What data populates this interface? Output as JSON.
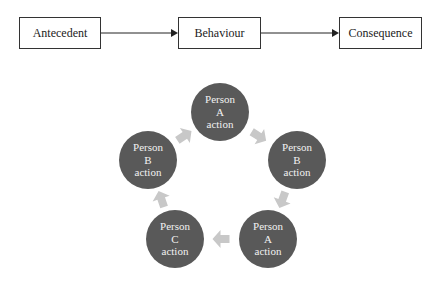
{
  "abc_flow": {
    "antecedent": "Antecedent",
    "behaviour": "Behaviour",
    "consequence": "Consequence"
  },
  "cycle": {
    "nodes": [
      {
        "line1": "Person",
        "line2": "A",
        "line3": "action"
      },
      {
        "line1": "Person",
        "line2": "B",
        "line3": "action"
      },
      {
        "line1": "Person",
        "line2": "A",
        "line3": "action"
      },
      {
        "line1": "Person",
        "line2": "C",
        "line3": "action"
      },
      {
        "line1": "Person",
        "line2": "B",
        "line3": "action"
      }
    ]
  },
  "colors": {
    "node_fill": "#595959",
    "node_text": "#f2f2f2",
    "cycle_arrow": "#c8c8c8",
    "flow_line": "#222222",
    "box_border": "#333333"
  }
}
